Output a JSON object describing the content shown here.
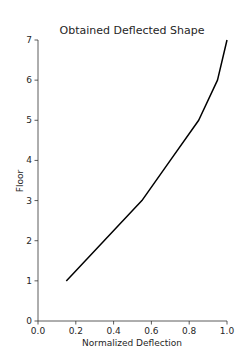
{
  "chart_data": {
    "type": "line",
    "title": "Obtained Deflected Shape",
    "xlabel": "Normalized Deflection",
    "ylabel": "Floor",
    "xlim": [
      0.0,
      1.0
    ],
    "ylim": [
      0,
      7
    ],
    "xticks": [
      "0.0",
      "0.2",
      "0.4",
      "0.6",
      "0.8",
      "1.0"
    ],
    "yticks": [
      "0",
      "1",
      "2",
      "3",
      "4",
      "5",
      "6",
      "7"
    ],
    "grid": false,
    "legend": null,
    "series": [
      {
        "name": "Deflected Shape",
        "color": "#000000",
        "x": [
          0.15,
          0.35,
          0.55,
          0.7,
          0.85,
          0.95,
          1.0
        ],
        "y": [
          1,
          2,
          3,
          4,
          5,
          6,
          7
        ]
      }
    ]
  }
}
